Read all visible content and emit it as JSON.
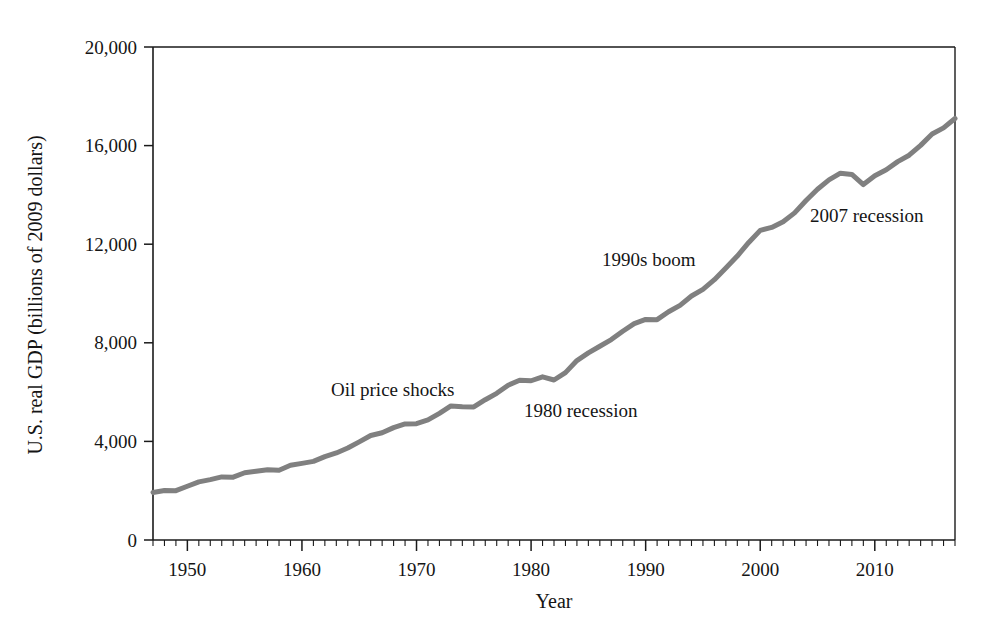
{
  "chart_data": {
    "type": "line",
    "title": "",
    "xlabel": "Year",
    "ylabel": "U.S. real GDP (billions of 2009 dollars)",
    "xlim": [
      1947,
      2017
    ],
    "ylim": [
      0,
      20000
    ],
    "grid": false,
    "legend": "none",
    "line_color": "#808080",
    "axis_color": "#1a1a1a",
    "x_ticks_major": [
      1950,
      1960,
      1970,
      1980,
      1990,
      2000,
      2010
    ],
    "x_tick_labels": [
      "1950",
      "1960",
      "1970",
      "1980",
      "1990",
      "2000",
      "2010"
    ],
    "x_tick_minor_step": 1,
    "y_ticks": [
      0,
      4000,
      8000,
      12000,
      16000,
      20000
    ],
    "y_tick_labels": [
      "0",
      "4,000",
      "8,000",
      "12,000",
      "16,000",
      "20,000"
    ],
    "series": [
      {
        "name": "U.S. real GDP",
        "x": [
          1947,
          1948,
          1949,
          1950,
          1951,
          1952,
          1953,
          1954,
          1955,
          1956,
          1957,
          1958,
          1959,
          1960,
          1961,
          1962,
          1963,
          1964,
          1965,
          1966,
          1967,
          1968,
          1969,
          1970,
          1971,
          1972,
          1973,
          1974,
          1975,
          1976,
          1977,
          1978,
          1979,
          1980,
          1981,
          1982,
          1983,
          1984,
          1985,
          1986,
          1987,
          1988,
          1989,
          1990,
          1991,
          1992,
          1993,
          1994,
          1995,
          1996,
          1997,
          1998,
          1999,
          2000,
          2001,
          2002,
          2003,
          2004,
          2005,
          2006,
          2007,
          2008,
          2009,
          2010,
          2011,
          2012,
          2013,
          2014,
          2015,
          2016,
          2017
        ],
        "values": [
          1930,
          2010,
          2000,
          2180,
          2360,
          2450,
          2560,
          2550,
          2730,
          2790,
          2850,
          2830,
          3030,
          3110,
          3190,
          3380,
          3530,
          3730,
          3980,
          4240,
          4350,
          4560,
          4710,
          4720,
          4870,
          5140,
          5440,
          5410,
          5400,
          5690,
          5950,
          6280,
          6480,
          6460,
          6620,
          6490,
          6790,
          7280,
          7590,
          7860,
          8130,
          8470,
          8780,
          8950,
          8940,
          9260,
          9520,
          9900,
          10170,
          10560,
          11030,
          11520,
          12070,
          12560,
          12680,
          12910,
          13270,
          13770,
          14230,
          14610,
          14880,
          14830,
          14420,
          14780,
          15020,
          15350,
          15610,
          16010,
          16470,
          16720,
          17100
        ]
      }
    ],
    "annotations": [
      {
        "id": "oil-price-shocks",
        "text": "Oil price shocks",
        "x_px": 331,
        "y_px": 396
      },
      {
        "id": "recession-1980",
        "text": "1980 recession",
        "x_px": 524,
        "y_px": 417
      },
      {
        "id": "boom-1990s",
        "text": "1990s boom",
        "x_px": 602,
        "y_px": 266
      },
      {
        "id": "recession-2007",
        "text": "2007 recession",
        "x_px": 810,
        "y_px": 222
      }
    ]
  },
  "figure": {
    "plot_left_px": 153,
    "plot_right_px": 955,
    "plot_top_px": 47,
    "plot_bottom_px": 540,
    "xlabel_center_px": 554,
    "xlabel_baseline_px": 608,
    "ylabel_center_px": 295,
    "ylabel_x_px": 42
  }
}
